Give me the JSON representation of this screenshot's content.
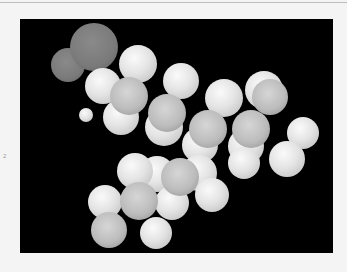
{
  "figure": {
    "type": "space-filling molecular model",
    "background_color": "#000000",
    "side_mark": "2"
  },
  "atoms": [
    {
      "el": "O",
      "x": 48,
      "y": 46,
      "r": 17
    },
    {
      "el": "O",
      "x": 74,
      "y": 28,
      "r": 24
    },
    {
      "el": "H",
      "x": 66,
      "y": 96,
      "r": 7
    },
    {
      "el": "H",
      "x": 83,
      "y": 67,
      "r": 18
    },
    {
      "el": "H",
      "x": 118,
      "y": 45,
      "r": 19
    },
    {
      "el": "H",
      "x": 161,
      "y": 62,
      "r": 18
    },
    {
      "el": "H",
      "x": 101,
      "y": 98,
      "r": 18
    },
    {
      "el": "H",
      "x": 144,
      "y": 108,
      "r": 19
    },
    {
      "el": "H",
      "x": 204,
      "y": 79,
      "r": 19
    },
    {
      "el": "H",
      "x": 244,
      "y": 71,
      "r": 19
    },
    {
      "el": "H",
      "x": 283,
      "y": 114,
      "r": 16
    },
    {
      "el": "H",
      "x": 180,
      "y": 126,
      "r": 18
    },
    {
      "el": "H",
      "x": 226,
      "y": 127,
      "r": 18
    },
    {
      "el": "H",
      "x": 267,
      "y": 140,
      "r": 18
    },
    {
      "el": "H",
      "x": 224,
      "y": 144,
      "r": 16
    },
    {
      "el": "H",
      "x": 179,
      "y": 154,
      "r": 18
    },
    {
      "el": "H",
      "x": 137,
      "y": 155,
      "r": 18
    },
    {
      "el": "H",
      "x": 115,
      "y": 152,
      "r": 18
    },
    {
      "el": "H",
      "x": 192,
      "y": 176,
      "r": 17
    },
    {
      "el": "H",
      "x": 152,
      "y": 184,
      "r": 17
    },
    {
      "el": "H",
      "x": 85,
      "y": 183,
      "r": 17
    },
    {
      "el": "H",
      "x": 136,
      "y": 214,
      "r": 16
    },
    {
      "el": "C",
      "x": 109,
      "y": 77,
      "r": 19
    },
    {
      "el": "C",
      "x": 147,
      "y": 94,
      "r": 19
    },
    {
      "el": "C",
      "x": 188,
      "y": 110,
      "r": 19
    },
    {
      "el": "C",
      "x": 231,
      "y": 110,
      "r": 19
    },
    {
      "el": "C",
      "x": 250,
      "y": 78,
      "r": 18
    },
    {
      "el": "C",
      "x": 160,
      "y": 158,
      "r": 19
    },
    {
      "el": "C",
      "x": 119,
      "y": 182,
      "r": 19
    },
    {
      "el": "C",
      "x": 89,
      "y": 211,
      "r": 18
    }
  ]
}
